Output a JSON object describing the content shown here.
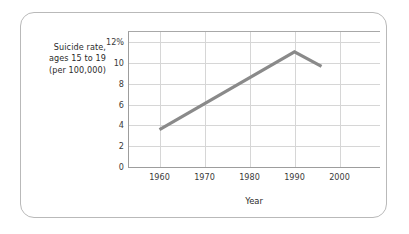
{
  "chart_data": {
    "type": "line",
    "title": "",
    "ylabel_lines": [
      "Suicide rate,",
      "ages 15 to 19",
      "(per 100,000)"
    ],
    "xlabel": "Year",
    "x": [
      1960,
      1990,
      1996
    ],
    "values": [
      3.6,
      11.1,
      9.7
    ],
    "series": [
      {
        "name": "Suicide rate, ages 15 to 19 (per 100,000)",
        "points": [
          {
            "x": 1960,
            "y": 3.6
          },
          {
            "x": 1990,
            "y": 11.1
          },
          {
            "x": 1996,
            "y": 9.7
          }
        ]
      }
    ],
    "xlim": [
      1953,
      2009
    ],
    "ylim": [
      0,
      13.1
    ],
    "xticks": [
      1960,
      1970,
      1980,
      1990,
      2000
    ],
    "xtick_labels": [
      "1960",
      "1970",
      "1980",
      "1990",
      "2000"
    ],
    "yticks": [
      0,
      2,
      4,
      6,
      8,
      10,
      12
    ],
    "ytick_labels": [
      "0",
      "2",
      "4",
      "6",
      "8",
      "10",
      "12%"
    ],
    "grid": true,
    "legend": "none",
    "line_color": "#8a8a8a",
    "grid_color": "#d6d6d6",
    "axis_color": "#9d9d9d"
  },
  "frame": {
    "border_color": "#b9b9b9"
  }
}
